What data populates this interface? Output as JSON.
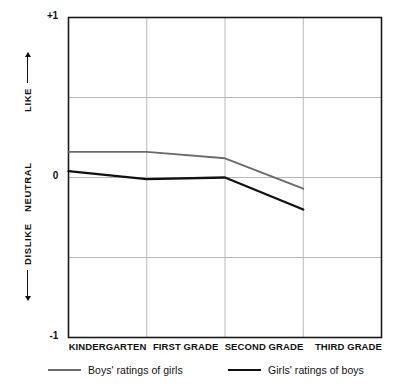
{
  "chart_data": {
    "type": "line",
    "title": "",
    "subtitle": "",
    "xlabel": "",
    "ylabel": "",
    "categories": [
      "KINDERGARTEN",
      "FIRST GRADE",
      "SECOND GRADE",
      "THIRD GRADE"
    ],
    "ylim": [
      -1,
      1
    ],
    "ytick_labels": [
      "+1",
      "0",
      "-1"
    ],
    "ytick_values": [
      1,
      0,
      -1
    ],
    "y_region_labels": [
      "LIKE",
      "NEUTRAL",
      "DISLIKE"
    ],
    "gridlines": {
      "horizontal_values": [
        0.5,
        0,
        -0.5
      ],
      "vertical_at_categories": true,
      "grid": true
    },
    "legend_position": "bottom",
    "series": [
      {
        "name": "Boys' ratings of girls",
        "color": "#6b6b6b",
        "values": [
          0.16,
          0.16,
          0.12,
          -0.07
        ]
      },
      {
        "name": "Girls' ratings of boys",
        "color": "#111111",
        "values": [
          0.04,
          -0.01,
          0.0,
          -0.2
        ]
      }
    ]
  },
  "axis": {
    "y_top_label": "+1",
    "y_zero_label": "0",
    "y_bottom_label": "-1",
    "like_label": "LIKE",
    "neutral_label": "NEUTRAL",
    "dislike_label": "DISLIKE"
  },
  "legend": {
    "entries": [
      {
        "label": "Boys' ratings of girls",
        "color": "#6b6b6b"
      },
      {
        "label": "Girls' ratings of boys",
        "color": "#111111"
      }
    ]
  },
  "colors": {
    "series_boys": "#6b6b6b",
    "series_girls": "#111111",
    "grid": "#b8b8b8",
    "frame": "#1a1a1a",
    "background": "#ffffff"
  }
}
